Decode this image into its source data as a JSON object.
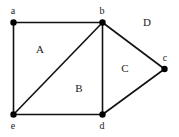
{
  "diagram": {
    "type": "planar-graph",
    "vertices": [
      {
        "id": "a",
        "label": "a",
        "x": 13.5,
        "y": 22.5,
        "lx": 13,
        "ly": 14
      },
      {
        "id": "b",
        "label": "b",
        "x": 102.5,
        "y": 22.5,
        "lx": 102,
        "ly": 14
      },
      {
        "id": "c",
        "label": "c",
        "x": 164.5,
        "y": 69,
        "lx": 165,
        "ly": 61
      },
      {
        "id": "d",
        "label": "d",
        "x": 102.5,
        "y": 114.5,
        "lx": 102,
        "ly": 129
      },
      {
        "id": "e",
        "label": "e",
        "x": 13.5,
        "y": 114.5,
        "lx": 13,
        "ly": 129
      }
    ],
    "edges": [
      {
        "from": "a",
        "to": "b"
      },
      {
        "from": "a",
        "to": "e"
      },
      {
        "from": "b",
        "to": "e"
      },
      {
        "from": "b",
        "to": "d"
      },
      {
        "from": "b",
        "to": "c"
      },
      {
        "from": "c",
        "to": "d"
      },
      {
        "from": "e",
        "to": "d"
      }
    ],
    "faces": [
      {
        "id": "A",
        "label": "A",
        "x": 40,
        "y": 53
      },
      {
        "id": "B",
        "label": "B",
        "x": 79,
        "y": 92
      },
      {
        "id": "C",
        "label": "C",
        "x": 125,
        "y": 72
      },
      {
        "id": "D",
        "label": "D",
        "x": 147,
        "y": 26
      }
    ]
  }
}
